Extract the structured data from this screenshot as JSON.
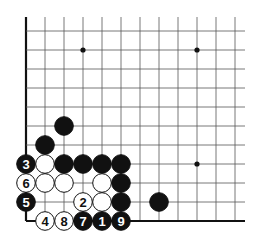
{
  "board": {
    "origin_x": 26,
    "origin_y": 221,
    "spacing": 19,
    "cols": 12,
    "rows": 11,
    "top_y": 17,
    "right_x": 245,
    "line_color": "#555555",
    "edge_color": "#111111"
  },
  "star_points": [
    [
      3,
      9
    ],
    [
      9,
      9
    ],
    [
      9,
      3
    ]
  ],
  "stones": [
    {
      "col": 2,
      "row": 5,
      "color": "black",
      "label": ""
    },
    {
      "col": 1,
      "row": 4,
      "color": "black",
      "label": ""
    },
    {
      "col": 0,
      "row": 3,
      "color": "black",
      "label": "3"
    },
    {
      "col": 1,
      "row": 3,
      "color": "white",
      "label": ""
    },
    {
      "col": 2,
      "row": 3,
      "color": "black",
      "label": ""
    },
    {
      "col": 3,
      "row": 3,
      "color": "black",
      "label": ""
    },
    {
      "col": 4,
      "row": 3,
      "color": "black",
      "label": ""
    },
    {
      "col": 5,
      "row": 3,
      "color": "black",
      "label": ""
    },
    {
      "col": 0,
      "row": 2,
      "color": "white",
      "label": "6"
    },
    {
      "col": 1,
      "row": 2,
      "color": "white",
      "label": ""
    },
    {
      "col": 2,
      "row": 2,
      "color": "white",
      "label": ""
    },
    {
      "col": 4,
      "row": 2,
      "color": "white",
      "label": ""
    },
    {
      "col": 5,
      "row": 2,
      "color": "black",
      "label": ""
    },
    {
      "col": 0,
      "row": 1,
      "color": "black",
      "label": "5"
    },
    {
      "col": 3,
      "row": 1,
      "color": "white",
      "label": "2"
    },
    {
      "col": 4,
      "row": 1,
      "color": "white",
      "label": ""
    },
    {
      "col": 5,
      "row": 1,
      "color": "black",
      "label": ""
    },
    {
      "col": 7,
      "row": 1,
      "color": "black",
      "label": ""
    },
    {
      "col": 1,
      "row": 0,
      "color": "white",
      "label": "4"
    },
    {
      "col": 2,
      "row": 0,
      "color": "white",
      "label": "8"
    },
    {
      "col": 3,
      "row": 0,
      "color": "black",
      "label": "7"
    },
    {
      "col": 4,
      "row": 0,
      "color": "black",
      "label": "1"
    },
    {
      "col": 5,
      "row": 0,
      "color": "black",
      "label": "9"
    }
  ]
}
